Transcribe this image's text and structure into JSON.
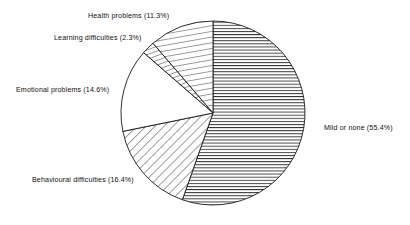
{
  "chart_data": {
    "type": "pie",
    "title": "",
    "subtitle": "",
    "xlabel": "",
    "ylabel": "",
    "legend_position": "none",
    "grid": false,
    "units": "percent",
    "start_angle_deg": 0,
    "direction": "clockwise",
    "total": 100.0,
    "categories": [
      "Mild or none",
      "Behavioural difficulties",
      "Emotional problems",
      "Learning difficulties",
      "Health problems"
    ],
    "values": [
      55.4,
      16.4,
      14.6,
      2.3,
      11.3
    ],
    "slices": [
      {
        "label": "Mild or none",
        "value": 55.4,
        "label_text": "Mild or none (55.4%)",
        "pattern": "horizontal-hatch",
        "fill": "#ffffff",
        "stroke": "#1a1a1a"
      },
      {
        "label": "Behavioural difficulties",
        "value": 16.4,
        "label_text": "Behavioural difficulties (16.4%)",
        "pattern": "diagonal-hatch-45",
        "fill": "#ffffff",
        "stroke": "#1a1a1a"
      },
      {
        "label": "Emotional problems",
        "value": 14.6,
        "label_text": "Emotional problems (14.6%)",
        "pattern": "blank",
        "fill": "#ffffff",
        "stroke": "#1a1a1a"
      },
      {
        "label": "Learning difficulties",
        "value": 2.3,
        "label_text": "Learning difficulties (2.3%)",
        "pattern": "diagonal-hatch-steep",
        "fill": "#ffffff",
        "stroke": "#1a1a1a"
      },
      {
        "label": "Health problems",
        "value": 11.3,
        "label_text": "Health problems (11.3%)",
        "pattern": "vertical-hatch",
        "fill": "#ffffff",
        "stroke": "#1a1a1a"
      }
    ],
    "geometry": {
      "center_x": 213,
      "center_y": 113,
      "radius": 92
    },
    "colors": {
      "background": "#ffffff",
      "outline": "#1a1a1a",
      "text": "#111111"
    }
  }
}
